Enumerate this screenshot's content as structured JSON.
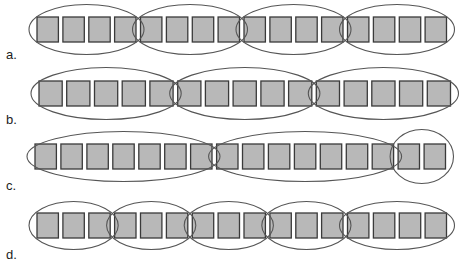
{
  "diagram": {
    "colors": {
      "square_fill": "#b8b8b8",
      "square_stroke": "#3a3a3a",
      "ellipse_stroke": "#555555"
    },
    "rows": [
      {
        "label": "a.",
        "square_count": 16,
        "groups": [
          4,
          4,
          4,
          4
        ]
      },
      {
        "label": "b.",
        "square_count": 15,
        "groups": [
          5,
          5,
          5
        ]
      },
      {
        "label": "c.",
        "square_count": 16,
        "groups": [
          7,
          7,
          2
        ]
      },
      {
        "label": "d.",
        "square_count": 16,
        "groups": [
          3,
          3,
          3,
          3,
          4
        ]
      }
    ]
  }
}
